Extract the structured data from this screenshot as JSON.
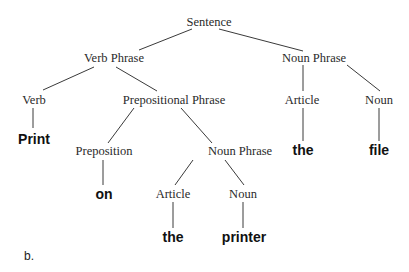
{
  "diagram": {
    "type": "parse-tree",
    "caption": "b.",
    "nodes": {
      "sentence": "Sentence",
      "vp": "Verb Phrase",
      "np_top": "Noun Phrase",
      "verb": "Verb",
      "pp": "Prepositional Phrase",
      "article_top": "Article",
      "noun_top": "Noun",
      "print": "Print",
      "preposition": "Preposition",
      "np_inner": "Noun Phrase",
      "the_top": "the",
      "file": "file",
      "on": "on",
      "article_inner": "Article",
      "noun_inner": "Noun",
      "the_inner": "the",
      "printer": "printer"
    },
    "edges": [
      [
        "Sentence",
        "Verb Phrase"
      ],
      [
        "Sentence",
        "Noun Phrase"
      ],
      [
        "Verb Phrase",
        "Verb"
      ],
      [
        "Verb Phrase",
        "Prepositional Phrase"
      ],
      [
        "Noun Phrase",
        "Article"
      ],
      [
        "Noun Phrase",
        "Noun"
      ],
      [
        "Verb",
        "Print"
      ],
      [
        "Prepositional Phrase",
        "Preposition"
      ],
      [
        "Prepositional Phrase",
        "Noun Phrase"
      ],
      [
        "Article",
        "the"
      ],
      [
        "Noun",
        "file"
      ],
      [
        "Preposition",
        "on"
      ],
      [
        "Noun Phrase",
        "Article"
      ],
      [
        "Noun Phrase",
        "Noun"
      ],
      [
        "Article",
        "the"
      ],
      [
        "Noun",
        "printer"
      ]
    ]
  }
}
